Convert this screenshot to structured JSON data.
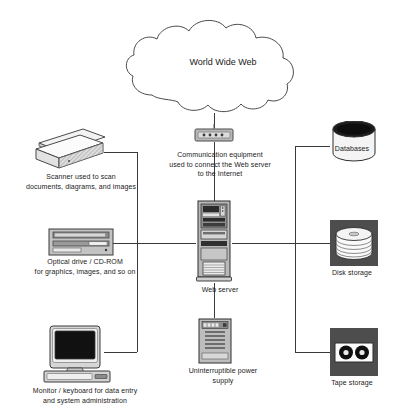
{
  "diagram": {
    "background": "#ffffff",
    "line_color": "#3a3a3a",
    "stroke_color": "#4a4a4a"
  },
  "cloud": {
    "label": "World Wide Web",
    "icon": "cloud-icon"
  },
  "nodes": [
    {
      "id": "communication-equipment",
      "icon": "router-icon",
      "label": "Communication equipment\nused to connect the Web server\nto the Internet",
      "label_left": 152,
      "label_top": 150,
      "label_width": 136
    },
    {
      "id": "scanner",
      "icon": "scanner-icon",
      "label": "Scanner used to scan\ndocuments, diagrams, and images",
      "label_left": 12,
      "label_top": 172,
      "label_width": 138
    },
    {
      "id": "optical-drive",
      "icon": "optical-drive-icon",
      "label": "Optical drive / CD-ROM\nfor graphics, images, and so on",
      "label_left": 16,
      "label_top": 257,
      "label_width": 138
    },
    {
      "id": "workstation",
      "icon": "monitor-keyboard-icon",
      "label": "Monitor / keyboard for data entry\nand system administration",
      "label_left": 14,
      "label_top": 386,
      "label_width": 142
    },
    {
      "id": "web-server",
      "icon": "server-tower-icon",
      "label": "Web server",
      "label_left": 178,
      "label_top": 285,
      "label_width": 84
    },
    {
      "id": "ups",
      "icon": "ups-icon",
      "label": "Uninterruptible power\nsupply",
      "label_left": 176,
      "label_top": 366,
      "label_width": 94
    },
    {
      "id": "databases",
      "icon": "database-cylinder-icon",
      "label": "Databases",
      "label_left": 320,
      "label_top": 144,
      "label_width": 64
    },
    {
      "id": "disk-storage",
      "icon": "disk-platter-stack-icon",
      "label": "Disk storage",
      "label_left": 318,
      "label_top": 268,
      "label_width": 68
    },
    {
      "id": "tape-storage",
      "icon": "tape-cassette-icon",
      "label": "Tape storage",
      "label_left": 318,
      "label_top": 378,
      "label_width": 68
    }
  ]
}
